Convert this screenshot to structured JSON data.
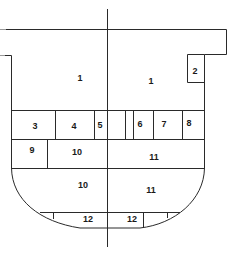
{
  "diagram": {
    "type": "ship-cross-section-compartments",
    "line_color": "#2a2a2a",
    "background": "#ffffff",
    "compartments": [
      {
        "id": "c1-left",
        "label": "1",
        "x": 80,
        "y": 78
      },
      {
        "id": "c1-right",
        "label": "1",
        "x": 151,
        "y": 81
      },
      {
        "id": "c2",
        "label": "2",
        "x": 195,
        "y": 71
      },
      {
        "id": "c3",
        "label": "3",
        "x": 35,
        "y": 126
      },
      {
        "id": "c4",
        "label": "4",
        "x": 74,
        "y": 126
      },
      {
        "id": "c5",
        "label": "5",
        "x": 100,
        "y": 125
      },
      {
        "id": "c6",
        "label": "6",
        "x": 140,
        "y": 124
      },
      {
        "id": "c7",
        "label": "7",
        "x": 164,
        "y": 124
      },
      {
        "id": "c8",
        "label": "8",
        "x": 189,
        "y": 123
      },
      {
        "id": "c9",
        "label": "9",
        "x": 32,
        "y": 150
      },
      {
        "id": "c10-upper",
        "label": "10",
        "x": 77,
        "y": 152
      },
      {
        "id": "c11-upper",
        "label": "11",
        "x": 154,
        "y": 157
      },
      {
        "id": "c10-lower",
        "label": "10",
        "x": 83,
        "y": 185
      },
      {
        "id": "c11-lower",
        "label": "11",
        "x": 151,
        "y": 190
      },
      {
        "id": "c12-left",
        "label": "12",
        "x": 88,
        "y": 219
      },
      {
        "id": "c12-right",
        "label": "12",
        "x": 132,
        "y": 219
      }
    ]
  }
}
